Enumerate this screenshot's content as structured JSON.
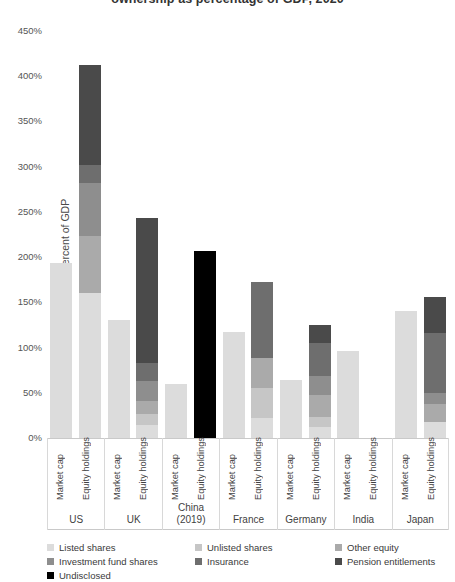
{
  "title": "ownership as percentage of GDP, 2020",
  "axis": {
    "ylabel": "percent of GDP",
    "yticks": [
      "0%",
      "50%",
      "100%",
      "150%",
      "200%",
      "250%",
      "300%",
      "350%",
      "400%",
      "450%"
    ],
    "sublabel_market_cap": "Market cap",
    "sublabel_equity_holdings": "Equity holdings"
  },
  "legend": {
    "items": [
      {
        "label": "Listed shares",
        "color": "#dcdcdc"
      },
      {
        "label": "Unlisted shares",
        "color": "#c6c6c6"
      },
      {
        "label": "Other equity",
        "color": "#aaaaaa"
      },
      {
        "label": "Investment fund shares",
        "color": "#8e8e8e"
      },
      {
        "label": "Insurance",
        "color": "#6e6e6e"
      },
      {
        "label": "Pension entitlements",
        "color": "#4a4a4a"
      },
      {
        "label": "Undisclosed",
        "color": "#000000"
      }
    ]
  },
  "chart_data": {
    "type": "bar",
    "title": "ownership as percentage of GDP, 2020",
    "xlabel": "",
    "ylabel": "percent of GDP",
    "ylim": [
      0,
      450
    ],
    "ytick_step": 50,
    "grid": false,
    "stacked": true,
    "legend_position": "bottom",
    "categories": [
      "US",
      "UK",
      "China (2019)",
      "France",
      "Germany",
      "India",
      "Japan"
    ],
    "sub_categories": [
      "Market cap",
      "Equity holdings"
    ],
    "series": [
      {
        "name": "Listed shares",
        "color": "#dcdcdc"
      },
      {
        "name": "Unlisted shares",
        "color": "#c6c6c6"
      },
      {
        "name": "Other equity",
        "color": "#aaaaaa"
      },
      {
        "name": "Investment fund shares",
        "color": "#8e8e8e"
      },
      {
        "name": "Insurance",
        "color": "#6e6e6e"
      },
      {
        "name": "Pension entitlements",
        "color": "#4a4a4a"
      },
      {
        "name": "Undisclosed",
        "color": "#000000"
      }
    ],
    "bars": [
      {
        "country": "US",
        "market_cap": {
          "total": 194,
          "segments": [
            {
              "series": "Listed shares",
              "value": 194
            }
          ]
        },
        "equity_holdings": {
          "total": 412,
          "segments": [
            {
              "series": "Listed shares",
              "value": 160
            },
            {
              "series": "Other equity",
              "value": 63
            },
            {
              "series": "Investment fund shares",
              "value": 59
            },
            {
              "series": "Insurance",
              "value": 20
            },
            {
              "series": "Pension entitlements",
              "value": 110
            }
          ]
        }
      },
      {
        "country": "UK",
        "market_cap": {
          "total": 131,
          "segments": [
            {
              "series": "Listed shares",
              "value": 131
            }
          ]
        },
        "equity_holdings": {
          "total": 243,
          "segments": [
            {
              "series": "Listed shares",
              "value": 14
            },
            {
              "series": "Unlisted shares",
              "value": 12
            },
            {
              "series": "Other equity",
              "value": 15
            },
            {
              "series": "Investment fund shares",
              "value": 22
            },
            {
              "series": "Insurance",
              "value": 20
            },
            {
              "series": "Pension entitlements",
              "value": 160
            }
          ]
        }
      },
      {
        "country": "China (2019)",
        "market_cap": {
          "total": 60,
          "segments": [
            {
              "series": "Listed shares",
              "value": 60
            }
          ]
        },
        "equity_holdings": {
          "total": 207,
          "segments": [
            {
              "series": "Undisclosed",
              "value": 207
            }
          ]
        }
      },
      {
        "country": "France",
        "market_cap": {
          "total": 117,
          "segments": [
            {
              "series": "Listed shares",
              "value": 117
            }
          ]
        },
        "equity_holdings": {
          "total": 172,
          "segments": [
            {
              "series": "Listed shares",
              "value": 22
            },
            {
              "series": "Unlisted shares",
              "value": 33
            },
            {
              "series": "Other equity",
              "value": 33
            },
            {
              "series": "Insurance",
              "value": 84
            }
          ]
        }
      },
      {
        "country": "Germany",
        "market_cap": {
          "total": 64,
          "segments": [
            {
              "series": "Listed shares",
              "value": 64
            }
          ]
        },
        "equity_holdings": {
          "total": 125,
          "segments": [
            {
              "series": "Listed shares",
              "value": 12
            },
            {
              "series": "Unlisted shares",
              "value": 11
            },
            {
              "series": "Other equity",
              "value": 25
            },
            {
              "series": "Investment fund shares",
              "value": 21
            },
            {
              "series": "Insurance",
              "value": 36
            },
            {
              "series": "Pension entitlements",
              "value": 20
            }
          ]
        }
      },
      {
        "country": "India",
        "market_cap": {
          "total": 96,
          "segments": [
            {
              "series": "Listed shares",
              "value": 96
            }
          ]
        },
        "equity_holdings": {
          "total": 0,
          "segments": []
        }
      },
      {
        "country": "Japan",
        "market_cap": {
          "total": 140,
          "segments": [
            {
              "series": "Listed shares",
              "value": 140
            }
          ]
        },
        "equity_holdings": {
          "total": 156,
          "segments": [
            {
              "series": "Listed shares",
              "value": 18
            },
            {
              "series": "Other equity",
              "value": 20
            },
            {
              "series": "Investment fund shares",
              "value": 12
            },
            {
              "series": "Insurance",
              "value": 66
            },
            {
              "series": "Pension entitlements",
              "value": 40
            }
          ]
        }
      }
    ]
  }
}
